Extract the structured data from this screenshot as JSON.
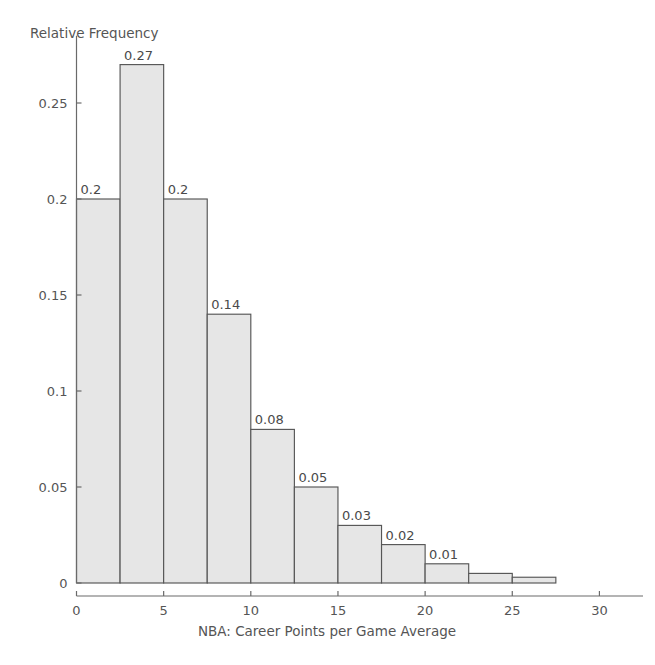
{
  "chart_data": {
    "type": "bar",
    "title": "",
    "subtitle": "",
    "xlabel": "NBA: Career Points per Game Average",
    "ylabel": "Relative Frequency",
    "xlim": [
      0,
      32.5
    ],
    "ylim": [
      0,
      0.285
    ],
    "grid": false,
    "legend": null,
    "bin_width": 2.5,
    "bin_edges": [
      0,
      2.5,
      5,
      7.5,
      10,
      12.5,
      15,
      17.5,
      20,
      22.5,
      25,
      27.5,
      30,
      32.5
    ],
    "categories": [
      "0-2.5",
      "2.5-5",
      "5-7.5",
      "7.5-10",
      "10-12.5",
      "12.5-15",
      "15-17.5",
      "17.5-20",
      "20-22.5",
      "22.5-25",
      "25-27.5",
      "27.5-30",
      "30-32.5"
    ],
    "values": [
      0.2,
      0.27,
      0.2,
      0.14,
      0.08,
      0.05,
      0.03,
      0.02,
      0.01,
      0.005,
      0.003,
      0.0,
      0.0
    ],
    "data_labels": [
      "0.2",
      "0.27",
      "0.2",
      "0.14",
      "0.08",
      "0.05",
      "0.03",
      "0.02",
      "0.01",
      "",
      "",
      "",
      ""
    ],
    "xticks": [
      0,
      5,
      10,
      15,
      20,
      25,
      30
    ],
    "xtick_labels": [
      "0",
      "5",
      "10",
      "15",
      "20",
      "25",
      "30"
    ],
    "yticks": [
      0,
      0.05,
      0.1,
      0.15,
      0.2,
      0.25
    ],
    "ytick_labels": [
      "0",
      "0.05",
      "0.1",
      "0.15",
      "0.2",
      "0.25"
    ],
    "bar_fill_color": "#e6e6e6",
    "bar_edge_color": "#565656",
    "axis_color": "#6a6a6a",
    "text_color": "#555555",
    "background_color": "#ffffff"
  }
}
